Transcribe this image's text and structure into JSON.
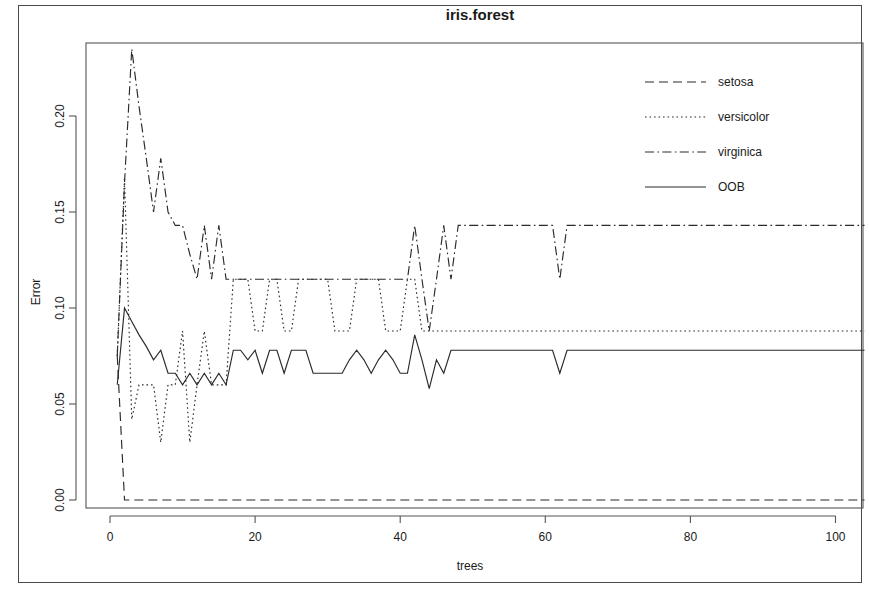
{
  "title": "iris.forest",
  "axes": {
    "xlabel": "trees",
    "ylabel": "Error",
    "xticks": [
      "0",
      "20",
      "40",
      "60",
      "80",
      "100"
    ],
    "yticks": [
      "0.00",
      "0.05",
      "0.10",
      "0.15",
      "0.20"
    ]
  },
  "legend": {
    "items": [
      {
        "label": "setosa",
        "style": "dashed"
      },
      {
        "label": "versicolor",
        "style": "dotted"
      },
      {
        "label": "virginica",
        "style": "dashdot"
      },
      {
        "label": "OOB",
        "style": "solid"
      }
    ]
  },
  "margin_text": {
    "line1": ":",
    "line2": "e",
    "line3": ")",
    "line4": "."
  },
  "chart_data": {
    "type": "line",
    "title": "iris.forest",
    "xlabel": "trees",
    "ylabel": "Error",
    "xlim": [
      0,
      104
    ],
    "ylim": [
      0,
      0.2405
    ],
    "xticks": [
      0,
      20,
      40,
      60,
      80,
      100
    ],
    "yticks": [
      0.0,
      0.05,
      0.1,
      0.15,
      0.2
    ],
    "grid": false,
    "legend_position": "top-right",
    "x": [
      1,
      2,
      3,
      4,
      5,
      6,
      7,
      8,
      9,
      10,
      11,
      12,
      13,
      14,
      15,
      16,
      17,
      18,
      19,
      20,
      21,
      22,
      23,
      24,
      25,
      26,
      27,
      28,
      29,
      30,
      31,
      32,
      33,
      34,
      35,
      36,
      37,
      38,
      39,
      40,
      41,
      42,
      43,
      44,
      45,
      46,
      47,
      48,
      49,
      50,
      51,
      52,
      53,
      54,
      55,
      56,
      57,
      58,
      59,
      60,
      61,
      62,
      63,
      64,
      65,
      66,
      67,
      68,
      69,
      70,
      71,
      72,
      73,
      74,
      75,
      76,
      77,
      78,
      79,
      80,
      81,
      82,
      83,
      84,
      85,
      86,
      87,
      88,
      89,
      90,
      91,
      92,
      93,
      94,
      95,
      96,
      97,
      98,
      99,
      100,
      101,
      102,
      103,
      104
    ],
    "series": [
      {
        "name": "setosa",
        "style": "dashed",
        "values": [
          0.075,
          0.0,
          0.0,
          0.0,
          0.0,
          0.0,
          0.0,
          0.0,
          0.0,
          0.0,
          0.0,
          0.0,
          0.0,
          0.0,
          0.0,
          0.0,
          0.0,
          0.0,
          0.0,
          0.0,
          0.0,
          0.0,
          0.0,
          0.0,
          0.0,
          0.0,
          0.0,
          0.0,
          0.0,
          0.0,
          0.0,
          0.0,
          0.0,
          0.0,
          0.0,
          0.0,
          0.0,
          0.0,
          0.0,
          0.0,
          0.0,
          0.0,
          0.0,
          0.0,
          0.0,
          0.0,
          0.0,
          0.0,
          0.0,
          0.0,
          0.0,
          0.0,
          0.0,
          0.0,
          0.0,
          0.0,
          0.0,
          0.0,
          0.0,
          0.0,
          0.0,
          0.0,
          0.0,
          0.0,
          0.0,
          0.0,
          0.0,
          0.0,
          0.0,
          0.0,
          0.0,
          0.0,
          0.0,
          0.0,
          0.0,
          0.0,
          0.0,
          0.0,
          0.0,
          0.0,
          0.0,
          0.0,
          0.0,
          0.0,
          0.0,
          0.0,
          0.0,
          0.0,
          0.0,
          0.0,
          0.0,
          0.0,
          0.0,
          0.0,
          0.0,
          0.0,
          0.0,
          0.0,
          0.0,
          0.0,
          0.0,
          0.0,
          0.0,
          0.0
        ]
      },
      {
        "name": "versicolor",
        "style": "dotted",
        "values": [
          0.075,
          0.168,
          0.042,
          0.06,
          0.06,
          0.06,
          0.03,
          0.06,
          0.06,
          0.088,
          0.03,
          0.06,
          0.088,
          0.06,
          0.06,
          0.06,
          0.115,
          0.115,
          0.115,
          0.088,
          0.088,
          0.115,
          0.115,
          0.088,
          0.088,
          0.115,
          0.115,
          0.115,
          0.115,
          0.115,
          0.088,
          0.088,
          0.088,
          0.115,
          0.115,
          0.115,
          0.115,
          0.088,
          0.088,
          0.088,
          0.115,
          0.115,
          0.088,
          0.088,
          0.088,
          0.088,
          0.088,
          0.088,
          0.088,
          0.088,
          0.088,
          0.088,
          0.088,
          0.088,
          0.088,
          0.088,
          0.088,
          0.088,
          0.088,
          0.088,
          0.088,
          0.088,
          0.088,
          0.088,
          0.088,
          0.088,
          0.088,
          0.088,
          0.088,
          0.088,
          0.088,
          0.088,
          0.088,
          0.088,
          0.088,
          0.088,
          0.088,
          0.088,
          0.088,
          0.088,
          0.088,
          0.088,
          0.088,
          0.088,
          0.088,
          0.088,
          0.088,
          0.088,
          0.088,
          0.088,
          0.088,
          0.088,
          0.088,
          0.088,
          0.088,
          0.088,
          0.088,
          0.088,
          0.088,
          0.088,
          0.088,
          0.088,
          0.088,
          0.088
        ]
      },
      {
        "name": "virginica",
        "style": "dashdot",
        "values": [
          0.075,
          0.165,
          0.235,
          0.205,
          0.178,
          0.15,
          0.178,
          0.15,
          0.143,
          0.143,
          0.128,
          0.115,
          0.143,
          0.115,
          0.143,
          0.115,
          0.115,
          0.115,
          0.115,
          0.115,
          0.115,
          0.115,
          0.115,
          0.115,
          0.115,
          0.115,
          0.115,
          0.115,
          0.115,
          0.115,
          0.115,
          0.115,
          0.115,
          0.115,
          0.115,
          0.115,
          0.115,
          0.115,
          0.115,
          0.115,
          0.115,
          0.143,
          0.115,
          0.088,
          0.115,
          0.143,
          0.115,
          0.143,
          0.143,
          0.143,
          0.143,
          0.143,
          0.143,
          0.143,
          0.143,
          0.143,
          0.143,
          0.143,
          0.143,
          0.143,
          0.143,
          0.115,
          0.143,
          0.143,
          0.143,
          0.143,
          0.143,
          0.143,
          0.143,
          0.143,
          0.143,
          0.143,
          0.143,
          0.143,
          0.143,
          0.143,
          0.143,
          0.143,
          0.143,
          0.143,
          0.143,
          0.143,
          0.143,
          0.143,
          0.143,
          0.143,
          0.143,
          0.143,
          0.143,
          0.143,
          0.143,
          0.143,
          0.143,
          0.143,
          0.143,
          0.143,
          0.143,
          0.143,
          0.143,
          0.143,
          0.143,
          0.143,
          0.143,
          0.143
        ]
      },
      {
        "name": "OOB",
        "style": "solid",
        "values": [
          0.06,
          0.1,
          0.093,
          0.086,
          0.08,
          0.073,
          0.078,
          0.066,
          0.066,
          0.06,
          0.066,
          0.06,
          0.066,
          0.06,
          0.066,
          0.06,
          0.078,
          0.078,
          0.073,
          0.078,
          0.066,
          0.078,
          0.078,
          0.066,
          0.078,
          0.078,
          0.078,
          0.066,
          0.066,
          0.066,
          0.066,
          0.066,
          0.073,
          0.078,
          0.073,
          0.066,
          0.073,
          0.078,
          0.073,
          0.066,
          0.066,
          0.086,
          0.073,
          0.058,
          0.073,
          0.066,
          0.078,
          0.078,
          0.078,
          0.078,
          0.078,
          0.078,
          0.078,
          0.078,
          0.078,
          0.078,
          0.078,
          0.078,
          0.078,
          0.078,
          0.078,
          0.066,
          0.078,
          0.078,
          0.078,
          0.078,
          0.078,
          0.078,
          0.078,
          0.078,
          0.078,
          0.078,
          0.078,
          0.078,
          0.078,
          0.078,
          0.078,
          0.078,
          0.078,
          0.078,
          0.078,
          0.078,
          0.078,
          0.078,
          0.078,
          0.078,
          0.078,
          0.078,
          0.078,
          0.078,
          0.078,
          0.078,
          0.078,
          0.078,
          0.078,
          0.078,
          0.078,
          0.078,
          0.078,
          0.078,
          0.078,
          0.078,
          0.078,
          0.078
        ]
      }
    ]
  }
}
